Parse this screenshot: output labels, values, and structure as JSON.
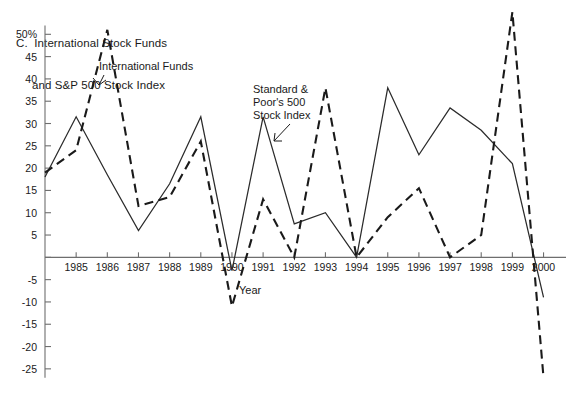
{
  "figure": {
    "panel_letter": "C.",
    "title_line_1": "C.  International Stock Funds",
    "title_line_2": "and S&P 500 Stock Index"
  },
  "annotations": {
    "international_funds": "International Funds",
    "sp500_line_1": "Standard &",
    "sp500_line_2": "Poor's 500",
    "sp500_line_3": "Stock Index",
    "year_label": "Year"
  },
  "axes": {
    "x_title": "Year",
    "y_unit_suffix": "%",
    "y_tick_labels": [
      "50%",
      "45",
      "40",
      "35",
      "30",
      "25",
      "20",
      "15",
      "10",
      "5",
      "",
      "-5",
      "-10",
      "-15",
      "-20",
      "-25"
    ],
    "y_tick_values": [
      50,
      45,
      40,
      35,
      30,
      25,
      20,
      15,
      10,
      5,
      0,
      -5,
      -10,
      -15,
      -20,
      -25
    ],
    "x_tick_labels": [
      "1985",
      "1986",
      "1987",
      "1988",
      "1989",
      "1990",
      "1991",
      "1992",
      "1993",
      "1994",
      "1995",
      "1996",
      "1997",
      "1998",
      "1999",
      "2000"
    ]
  },
  "colors": {
    "axis": "#6e6e6e",
    "solid_series": "#2b2b2b",
    "dashed_series": "#1a1a1a",
    "background": "#ffffff",
    "text": "#1a1a1a"
  },
  "chart_data": {
    "type": "line",
    "title": "C. International Stock Funds and S&P 500 Stock Index",
    "xlabel": "Year",
    "ylabel": "",
    "x": [
      1984,
      1985,
      1986,
      1987,
      1988,
      1989,
      1990,
      1991,
      1992,
      1993,
      1994,
      1995,
      1996,
      1997,
      1998,
      1999,
      2000
    ],
    "xlim": [
      1984,
      2000.4
    ],
    "ylim": [
      -27.5,
      55
    ],
    "y_ticks": [
      50,
      45,
      40,
      35,
      30,
      25,
      20,
      15,
      10,
      5,
      0,
      -5,
      -10,
      -15,
      -20,
      -25
    ],
    "x_ticks": [
      1985,
      1986,
      1987,
      1988,
      1989,
      1990,
      1991,
      1992,
      1993,
      1994,
      1995,
      1996,
      1997,
      1998,
      1999,
      2000
    ],
    "grid": false,
    "legend": "inline-annotations",
    "series": [
      {
        "name": "International Funds",
        "style": "dashed",
        "values": [
          19.0,
          24.0,
          51.0,
          11.5,
          13.5,
          26.0,
          -11.0,
          13.0,
          0.0,
          38.0,
          0.0,
          9.0,
          15.5,
          0.0,
          5.0,
          55.0,
          -27.0
        ]
      },
      {
        "name": "Standard & Poor's 500 Stock Index",
        "style": "solid",
        "values": [
          18.0,
          31.5,
          18.5,
          6.0,
          16.5,
          31.5,
          -3.0,
          31.5,
          7.5,
          10.0,
          0.0,
          38.0,
          23.0,
          33.5,
          28.5,
          21.0,
          -9.0
        ]
      }
    ]
  }
}
